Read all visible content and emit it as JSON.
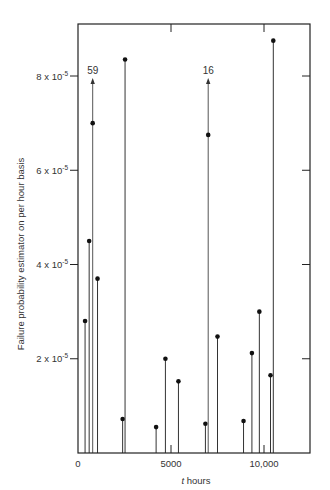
{
  "chart_data": {
    "type": "stem",
    "title": "",
    "xlabel": "t hours",
    "ylabel": "Failure probability estimator on per hour basis",
    "xlim": [
      0,
      12500
    ],
    "ylim": [
      0,
      9e-05
    ],
    "grid": false,
    "x_ticks": [
      {
        "value": 0,
        "label": "0"
      },
      {
        "value": 5000,
        "label": "5000"
      },
      {
        "value": 10000,
        "label": "10,000"
      }
    ],
    "y_ticks": [
      {
        "value": 2e-05,
        "label_base": "2 x 10",
        "label_exp": "-5"
      },
      {
        "value": 4e-05,
        "label_base": "4 x 10",
        "label_exp": "-5"
      },
      {
        "value": 6e-05,
        "label_base": "6 x 10",
        "label_exp": "-5"
      },
      {
        "value": 8e-05,
        "label_base": "8 x 10",
        "label_exp": "-5"
      }
    ],
    "points": [
      {
        "t": 380,
        "value": 2.8e-05
      },
      {
        "t": 600,
        "value": 4.5e-05
      },
      {
        "t": 790,
        "value": 7e-05,
        "off_scale_label": "59"
      },
      {
        "t": 1050,
        "value": 3.7e-05
      },
      {
        "t": 2400,
        "value": 7.2e-06
      },
      {
        "t": 2530,
        "value": 8.35e-05
      },
      {
        "t": 4200,
        "value": 5.5e-06
      },
      {
        "t": 4700,
        "value": 2e-05
      },
      {
        "t": 5400,
        "value": 1.52e-05
      },
      {
        "t": 6850,
        "value": 6.2e-06
      },
      {
        "t": 7000,
        "value": 6.75e-05,
        "off_scale_label": "16"
      },
      {
        "t": 7500,
        "value": 2.47e-05
      },
      {
        "t": 8900,
        "value": 6.8e-06
      },
      {
        "t": 9350,
        "value": 2.12e-05
      },
      {
        "t": 9750,
        "value": 3e-05
      },
      {
        "t": 10350,
        "value": 1.65e-05
      },
      {
        "t": 10500,
        "value": 8.75e-05
      }
    ],
    "annotations": [
      {
        "text": "59",
        "t": 790
      },
      {
        "text": "16",
        "t": 7000
      }
    ]
  }
}
